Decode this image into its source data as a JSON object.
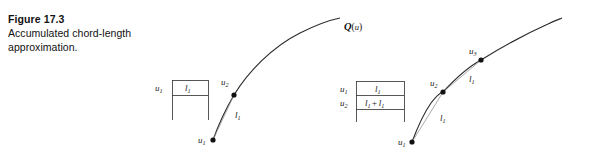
{
  "figure": {
    "number": "Figure 17.3",
    "caption_line_1": "Accumulated chord-length",
    "caption_line_2": "approximation."
  },
  "curve_label": {
    "symbol": "Q",
    "open_paren": "(",
    "argument": "u",
    "close_paren": ")"
  },
  "left_diagram": {
    "points": [
      {
        "label": "u",
        "subscript": "1"
      },
      {
        "label": "u",
        "subscript": "2"
      }
    ],
    "chord_labels": [
      {
        "label": "l",
        "subscript": "1"
      }
    ],
    "table": {
      "rows": [
        {
          "key": "u",
          "key_subscript": "1",
          "value": "l",
          "value_subscript": "1"
        }
      ]
    }
  },
  "right_diagram": {
    "points": [
      {
        "label": "u",
        "subscript": "1"
      },
      {
        "label": "u",
        "subscript": "2"
      },
      {
        "label": "u",
        "subscript": "3"
      }
    ],
    "chord_labels": [
      {
        "label": "l",
        "subscript": "1"
      },
      {
        "label": "l",
        "subscript": "1"
      }
    ],
    "table": {
      "rows": [
        {
          "key": "u",
          "key_subscript": "1",
          "value": "l",
          "value_subscript": "1"
        },
        {
          "key": "u",
          "key_subscript": "2",
          "value_first": "l",
          "value_first_subscript": "1",
          "operator": "+",
          "value_second": "l",
          "value_second_subscript": "1"
        }
      ]
    }
  },
  "colors": {
    "background": "#ffffff",
    "ink": "#1a1a1a",
    "curve": "#2b2b2b",
    "chord": "#8d8d8d",
    "rule": "#3a3a3a"
  }
}
